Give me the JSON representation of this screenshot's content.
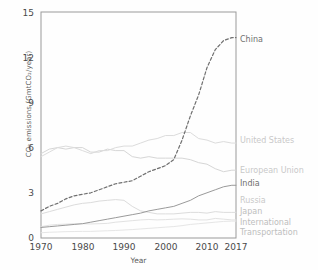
{
  "chart_data": {
    "type": "line",
    "title": "",
    "xlabel": "Year",
    "ylabel": "CO₂ emissions (GmtCO₂/year)",
    "xlim": [
      1970,
      2017
    ],
    "ylim": [
      0,
      15
    ],
    "xticks": [
      "1970",
      "1980",
      "1990",
      "2000",
      "2010",
      "2017"
    ],
    "xtick_values": [
      1970,
      1980,
      1990,
      2000,
      2010,
      2017
    ],
    "yticks": [
      "0",
      "3",
      "6",
      "9",
      "12",
      "15"
    ],
    "ytick_values": [
      0,
      3,
      6,
      9,
      12,
      15
    ],
    "grid": false,
    "legend_position": "right-inline",
    "x": [
      1970,
      1972,
      1974,
      1976,
      1978,
      1980,
      1982,
      1984,
      1986,
      1988,
      1990,
      1992,
      1994,
      1996,
      1998,
      2000,
      2002,
      2004,
      2006,
      2008,
      2010,
      2012,
      2014,
      2016,
      2017
    ],
    "series": [
      {
        "name": "China",
        "label": "China",
        "style": "dashed",
        "color": "#707070",
        "label_color": "#6f6f6f",
        "label_y": 40,
        "values": [
          1.8,
          2.1,
          2.3,
          2.6,
          2.8,
          2.9,
          3.0,
          3.2,
          3.4,
          3.6,
          3.7,
          3.8,
          4.1,
          4.4,
          4.6,
          4.8,
          5.2,
          6.5,
          8.1,
          9.5,
          11.3,
          12.5,
          13.1,
          13.3,
          13.3
        ]
      },
      {
        "name": "United States",
        "label": "United States",
        "style": "solid",
        "color": "#dcdcdc",
        "label_color": "#c9c9c9",
        "label_y": 140,
        "values": [
          5.4,
          5.7,
          6.0,
          6.1,
          6.0,
          5.8,
          5.6,
          5.8,
          5.8,
          6.0,
          6.1,
          6.1,
          6.3,
          6.5,
          6.6,
          6.8,
          6.8,
          7.0,
          7.0,
          6.6,
          6.5,
          6.3,
          6.4,
          6.3,
          6.3
        ]
      },
      {
        "name": "European Union",
        "label": "European Union",
        "style": "solid",
        "color": "#d6d6d6",
        "label_color": "#c9c9c9",
        "label_y": 170,
        "values": [
          5.6,
          5.9,
          6.0,
          5.9,
          6.0,
          6.0,
          5.7,
          5.7,
          5.9,
          5.8,
          5.8,
          5.4,
          5.3,
          5.4,
          5.3,
          5.3,
          5.3,
          5.3,
          5.2,
          5.0,
          4.9,
          4.6,
          4.4,
          4.5,
          4.5
        ]
      },
      {
        "name": "India",
        "label": "India",
        "style": "solid",
        "color": "#9a9a9a",
        "label_color": "#6f6f6f",
        "label_y": 183,
        "values": [
          0.7,
          0.75,
          0.8,
          0.85,
          0.9,
          0.95,
          1.05,
          1.15,
          1.25,
          1.35,
          1.45,
          1.55,
          1.65,
          1.8,
          1.9,
          2.0,
          2.1,
          2.3,
          2.5,
          2.8,
          3.0,
          3.2,
          3.4,
          3.5,
          3.5
        ]
      },
      {
        "name": "Russia",
        "label": "Russia",
        "style": "solid",
        "color": "#dcdcdc",
        "label_color": "#c9c9c9",
        "label_y": 200,
        "values": [
          1.6,
          1.75,
          1.9,
          2.05,
          2.2,
          2.3,
          2.35,
          2.45,
          2.5,
          2.55,
          2.5,
          2.1,
          1.8,
          1.7,
          1.6,
          1.6,
          1.6,
          1.65,
          1.7,
          1.7,
          1.65,
          1.75,
          1.7,
          1.7,
          1.7
        ]
      },
      {
        "name": "Japan",
        "label": "Japan",
        "style": "solid",
        "color": "#e2e2e2",
        "label_color": "#cfcfcf",
        "label_y": 211,
        "values": [
          0.75,
          0.85,
          0.9,
          0.92,
          0.95,
          0.95,
          0.93,
          0.95,
          0.97,
          1.05,
          1.1,
          1.15,
          1.2,
          1.23,
          1.2,
          1.22,
          1.25,
          1.27,
          1.25,
          1.2,
          1.2,
          1.3,
          1.25,
          1.2,
          1.2
        ]
      },
      {
        "name": "International Transportation",
        "label_line1": "International",
        "label_line2": "Transportation",
        "style": "solid",
        "color": "#e6e6e6",
        "label_color": "#cfcfcf",
        "label_y": 220,
        "values": [
          0.35,
          0.38,
          0.4,
          0.42,
          0.43,
          0.44,
          0.44,
          0.46,
          0.48,
          0.5,
          0.53,
          0.56,
          0.6,
          0.64,
          0.68,
          0.72,
          0.76,
          0.82,
          0.9,
          0.95,
          1.0,
          1.05,
          1.1,
          1.12,
          1.12
        ]
      }
    ]
  }
}
